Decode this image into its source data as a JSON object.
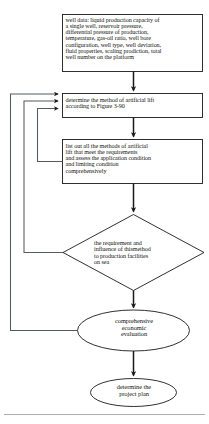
{
  "diagram": {
    "type": "flowchart",
    "stroke_color": "#1a1a1a",
    "text_color": "#111111",
    "background": "#ffffff",
    "nodes": [
      {
        "id": "well-data",
        "shape": "process",
        "text": "well data: liquid production capacity of\na single well, reservoir pressure,\ndifferential pressure of production,\ntemperature, gas-oil ratio, well bore\nconfiguration, well type, well deviation,\nfluid properties, scaling prodiction, total\nwell number on the platform"
      },
      {
        "id": "determine-method",
        "shape": "process",
        "text": "determine the method of artificial lift\n according to Figure 3-90"
      },
      {
        "id": "list-methods",
        "shape": "process",
        "text": "list out all the methods of artificial\nlift that meet the requirements\nand assess the application condition\nand limiting condition\ncomprehensively"
      },
      {
        "id": "decision-requirement",
        "shape": "decision",
        "text": "the requirement and\ninfluence of thismethod\nto production facilities\non sea"
      },
      {
        "id": "comprehensive-evaluation",
        "shape": "terminator",
        "text": "comprehensive\neconomic\nevaluation"
      },
      {
        "id": "project-plan",
        "shape": "terminator",
        "text": "determine the\nproject plan"
      }
    ],
    "edges": [
      {
        "id": "e1",
        "from": "well-data",
        "to": "determine-method",
        "kind": "arrow-down"
      },
      {
        "id": "e2",
        "from": "determine-method",
        "to": "list-methods",
        "kind": "arrow-down"
      },
      {
        "id": "e3",
        "from": "list-methods",
        "to": "decision-requirement",
        "kind": "arrow-down"
      },
      {
        "id": "e4",
        "from": "decision-requirement",
        "to": "comprehensive-evaluation",
        "kind": "arrow-down"
      },
      {
        "id": "e5",
        "from": "comprehensive-evaluation",
        "to": "project-plan",
        "kind": "arrow-down"
      },
      {
        "id": "fb1",
        "from": "list-methods",
        "to": "determine-method",
        "kind": "feedback-loop-left"
      },
      {
        "id": "fb2",
        "from": "decision-requirement",
        "to": "determine-method",
        "kind": "feedback-loop-left"
      },
      {
        "id": "fb3",
        "from": "comprehensive-evaluation",
        "to": "determine-method",
        "kind": "feedback-loop-left"
      }
    ]
  }
}
